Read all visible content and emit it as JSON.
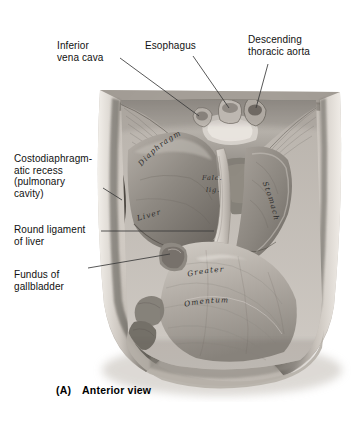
{
  "figure": {
    "caption_label": "(A)",
    "caption_text": "Anterior view",
    "caption_full": "(A)  Anterior view",
    "view": "Anterior view",
    "rendering": "grayscale anatomical illustration"
  },
  "callouts": [
    {
      "id": "inferior-vena-cava",
      "text": "Inferior\nvena cava"
    },
    {
      "id": "esophagus",
      "text": "Esophagus"
    },
    {
      "id": "descending-thoracic-aorta",
      "text": "Descending\nthoracic aorta"
    },
    {
      "id": "costodiaphragmatic-recess",
      "text": "Costodiaphragm-\natic recess\n(pulmonary\ncavity)"
    },
    {
      "id": "round-ligament-of-liver",
      "text": "Round ligament\nof liver"
    },
    {
      "id": "fundus-of-gallbladder",
      "text": "Fundus of\ngallbladder"
    }
  ],
  "in_image_labels": [
    {
      "id": "diaphragm",
      "text": "Diaphragm"
    },
    {
      "id": "falciform-ligament-line1",
      "text": "Falc."
    },
    {
      "id": "falciform-ligament-line2",
      "text": "lig."
    },
    {
      "id": "liver",
      "text": "Liver"
    },
    {
      "id": "stomach",
      "text": "Stomach"
    },
    {
      "id": "greater",
      "text": "Greater"
    },
    {
      "id": "omentum",
      "text": "Omentum"
    }
  ],
  "colors": {
    "background": "#ffffff",
    "text": "#111111",
    "leader_line": "#3a3a3a",
    "in_label": "#2b2b2b",
    "tissue_light": "#d8d4cf",
    "tissue_mid": "#a9a49e",
    "tissue_dark": "#6d6862",
    "tissue_darkest": "#3f3b37",
    "body_wall": "#cfc9c2"
  }
}
